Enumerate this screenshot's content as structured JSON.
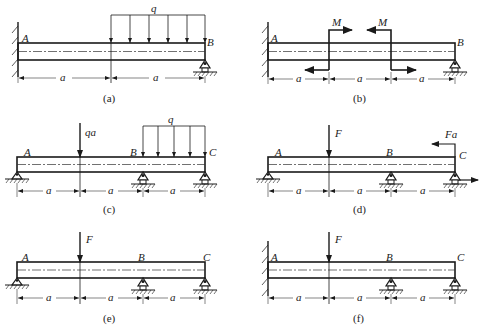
{
  "panels": [
    {
      "id": "a",
      "caption": "(a)",
      "left_label": "A",
      "right_label": "B",
      "load_label": "q",
      "dims": [
        "a",
        "a"
      ]
    },
    {
      "id": "b",
      "caption": "(b)",
      "left_label": "A",
      "right_label": "B",
      "moment_labels": [
        "M",
        "M"
      ],
      "dims": [
        "a",
        "a",
        "a"
      ]
    },
    {
      "id": "c",
      "caption": "(c)",
      "labels": [
        "A",
        "B",
        "C"
      ],
      "force_label": "qa",
      "load_label": "q",
      "dims": [
        "a",
        "a",
        "a"
      ]
    },
    {
      "id": "d",
      "caption": "(d)",
      "labels": [
        "A",
        "B",
        "C"
      ],
      "force_label": "F",
      "moment_label": "Fa",
      "dims": [
        "a",
        "a",
        "a"
      ]
    },
    {
      "id": "e",
      "caption": "(e)",
      "labels": [
        "A",
        "B",
        "C"
      ],
      "force_label": "F",
      "dims": [
        "a",
        "a",
        "a"
      ]
    },
    {
      "id": "f",
      "caption": "(f)",
      "labels": [
        "A",
        "B",
        "C"
      ],
      "force_label": "F",
      "dims": [
        "a",
        "a",
        "a"
      ]
    }
  ],
  "colors": {
    "line": "#1a1a1a",
    "background": "#ffffff"
  }
}
